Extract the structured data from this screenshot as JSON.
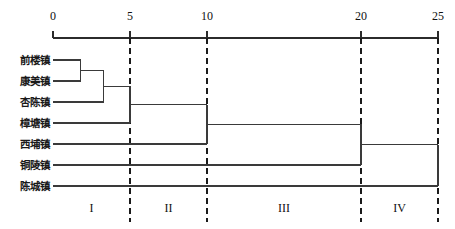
{
  "chart_data": {
    "type": "dendrogram",
    "title": "",
    "xlabel": "",
    "ylabel": "",
    "axis": {
      "position": "top",
      "range": [
        0,
        25
      ],
      "ticks": [
        0,
        5,
        10,
        20,
        25
      ],
      "tick_labels": [
        "0",
        "5",
        "10",
        "20",
        "25"
      ],
      "grid": false
    },
    "leaves": [
      {
        "label": "前楼镇",
        "order": 1
      },
      {
        "label": "康美镇",
        "order": 2
      },
      {
        "label": "杏陈镇",
        "order": 3
      },
      {
        "label": "樟塘镇",
        "order": 4
      },
      {
        "label": "西埔镇",
        "order": 5
      },
      {
        "label": "铜陵镇",
        "order": 6
      },
      {
        "label": "陈城镇",
        "order": 7
      }
    ],
    "merges": [
      {
        "id": "m1",
        "left": "前楼镇",
        "right": "康美镇",
        "distance": 1.8
      },
      {
        "id": "m2",
        "left": "m1",
        "right": "杏陈镇",
        "distance": 3.3
      },
      {
        "id": "m3",
        "left": "m2",
        "right": "樟塘镇",
        "distance": 5.0
      },
      {
        "id": "m4",
        "left": "m3",
        "right": "西埔镇",
        "distance": 10.0
      },
      {
        "id": "m5",
        "left": "m4",
        "right": "铜陵镇",
        "distance": 20.0
      },
      {
        "id": "m6",
        "left": "m5",
        "right": "陈城镇",
        "distance": 25.0
      }
    ],
    "cut_lines": [
      {
        "value": 5,
        "style": "dashed"
      },
      {
        "value": 10,
        "style": "dashed"
      },
      {
        "value": 20,
        "style": "dashed"
      },
      {
        "value": 25,
        "style": "dashed"
      }
    ],
    "clusters": [
      {
        "label": "I",
        "center": 2.5,
        "members": [
          "前楼镇",
          "康美镇",
          "杏陈镇",
          "樟塘镇"
        ]
      },
      {
        "label": "II",
        "center": 7.5,
        "members": [
          "西埔镇"
        ]
      },
      {
        "label": "III",
        "center": 15.0,
        "members": [
          "铜陵镇"
        ]
      },
      {
        "label": "IV",
        "center": 22.5,
        "members": [
          "陈城镇"
        ]
      }
    ],
    "colors": {
      "line": "#3a3a3a",
      "axis": "#2b2b2b",
      "dash": "#1a1a1a",
      "text": "#111111",
      "background": "#ffffff"
    }
  }
}
